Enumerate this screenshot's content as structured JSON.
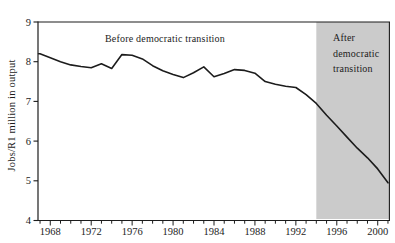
{
  "chart_data": {
    "type": "line",
    "title": "",
    "xlabel": "",
    "ylabel": "Jobs/R1 million in output",
    "ylim": [
      4,
      9
    ],
    "xlim": [
      1966.8,
      2001.2
    ],
    "y_ticks": [
      4,
      5,
      6,
      7,
      8,
      9
    ],
    "x_labeled_ticks": [
      1968,
      1972,
      1976,
      1980,
      1984,
      1988,
      1992,
      1996,
      2000
    ],
    "x_minor_tick_interval": 1,
    "x_minor_tick_start": 1967,
    "x_minor_tick_end": 2001,
    "grid": "off",
    "x": [
      1967,
      1968,
      1969,
      1970,
      1971,
      1972,
      1973,
      1974,
      1975,
      1976,
      1977,
      1978,
      1979,
      1980,
      1981,
      1982,
      1983,
      1984,
      1985,
      1986,
      1987,
      1988,
      1989,
      1990,
      1991,
      1992,
      1993,
      1994,
      1995,
      1996,
      1997,
      1998,
      1999,
      2000,
      2001
    ],
    "series": [
      {
        "name": "Jobs per R1 million in output",
        "values": [
          8.2,
          8.1,
          8.0,
          7.92,
          7.88,
          7.85,
          7.95,
          7.83,
          8.18,
          8.16,
          8.07,
          7.9,
          7.77,
          7.68,
          7.6,
          7.72,
          7.87,
          7.62,
          7.7,
          7.8,
          7.78,
          7.71,
          7.5,
          7.43,
          7.38,
          7.35,
          7.17,
          6.95,
          6.65,
          6.38,
          6.1,
          5.82,
          5.58,
          5.3,
          4.95
        ]
      }
    ],
    "annotations": [
      {
        "text": "Before democratic transition",
        "region": "before"
      },
      {
        "text": "After democratic transition",
        "region": "after"
      }
    ],
    "shaded_region": {
      "from_year": 1994,
      "to_year": 2001.2
    },
    "colors": {
      "line": "#1c1c1c",
      "axis": "#1c1c1c",
      "shaded_region_fill": "#cbcbcb",
      "background": "#ffffff"
    }
  }
}
